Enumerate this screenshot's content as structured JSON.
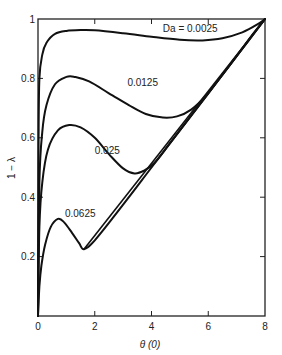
{
  "chart_data": {
    "type": "line",
    "title": "",
    "xlabel": "θ (0)",
    "ylabel": "1 − λ",
    "xlim": [
      0,
      8
    ],
    "ylim": [
      0,
      1
    ],
    "x_ticks": [
      0,
      2,
      4,
      6,
      8
    ],
    "x_tick_labels": [
      "0",
      "2",
      "4",
      "6",
      "8"
    ],
    "y_ticks": [
      0.2,
      0.4,
      0.6,
      0.8,
      1.0
    ],
    "y_tick_labels": [
      "0.2",
      "0.4",
      "0.6",
      "0.8",
      "1"
    ],
    "grid": false,
    "legend": "inline curve labels",
    "series": [
      {
        "name": "Da = 0.0025",
        "label": "Da = 0.0025",
        "label_pos": [
          4.4,
          0.955
        ],
        "points": [
          [
            0,
            0.0
          ],
          [
            0.02,
            0.6
          ],
          [
            0.05,
            0.8
          ],
          [
            0.15,
            0.88
          ],
          [
            0.3,
            0.92
          ],
          [
            0.6,
            0.95
          ],
          [
            1.0,
            0.96
          ],
          [
            1.5,
            0.963
          ],
          [
            2.0,
            0.962
          ],
          [
            3.0,
            0.952
          ],
          [
            4.0,
            0.94
          ],
          [
            5.0,
            0.93
          ],
          [
            5.8,
            0.928
          ],
          [
            6.5,
            0.935
          ],
          [
            7.2,
            0.955
          ],
          [
            7.7,
            0.98
          ],
          [
            8.0,
            1.0
          ]
        ]
      },
      {
        "name": "Da = 0.0125",
        "label": "0.0125",
        "label_pos": [
          3.15,
          0.775
        ],
        "points": [
          [
            0,
            0.0
          ],
          [
            0.05,
            0.45
          ],
          [
            0.15,
            0.62
          ],
          [
            0.3,
            0.71
          ],
          [
            0.6,
            0.78
          ],
          [
            1.0,
            0.805
          ],
          [
            1.3,
            0.805
          ],
          [
            1.8,
            0.79
          ],
          [
            2.5,
            0.75
          ],
          [
            3.2,
            0.71
          ],
          [
            3.8,
            0.68
          ],
          [
            4.4,
            0.668
          ],
          [
            4.9,
            0.672
          ],
          [
            5.4,
            0.695
          ],
          [
            5.9,
            0.74
          ],
          [
            6.4,
            0.8
          ],
          [
            7.0,
            0.875
          ],
          [
            7.5,
            0.94
          ],
          [
            8.0,
            1.0
          ]
        ]
      },
      {
        "name": "Da = 0.025",
        "label": "0.025",
        "label_pos": [
          2.0,
          0.545
        ],
        "points": [
          [
            0,
            0.0
          ],
          [
            0.05,
            0.3
          ],
          [
            0.15,
            0.45
          ],
          [
            0.35,
            0.56
          ],
          [
            0.7,
            0.625
          ],
          [
            1.1,
            0.643
          ],
          [
            1.5,
            0.635
          ],
          [
            2.0,
            0.6
          ],
          [
            2.5,
            0.545
          ],
          [
            3.0,
            0.497
          ],
          [
            3.4,
            0.48
          ],
          [
            3.75,
            0.49
          ],
          [
            4.1,
            0.515
          ],
          [
            4.6,
            0.575
          ],
          [
            5.2,
            0.65
          ],
          [
            6.0,
            0.75
          ],
          [
            7.0,
            0.875
          ],
          [
            8.0,
            1.0
          ]
        ]
      },
      {
        "name": "Da = 0.0625",
        "label": "0.0625",
        "label_pos": [
          0.95,
          0.335
        ],
        "points": [
          [
            0,
            0.0
          ],
          [
            0.05,
            0.1
          ],
          [
            0.12,
            0.17
          ],
          [
            0.25,
            0.24
          ],
          [
            0.45,
            0.3
          ],
          [
            0.7,
            0.327
          ],
          [
            0.9,
            0.318
          ],
          [
            1.2,
            0.28
          ],
          [
            1.45,
            0.245
          ],
          [
            1.62,
            0.225
          ],
          [
            2.0,
            0.255
          ],
          [
            3.0,
            0.375
          ],
          [
            4.0,
            0.5
          ],
          [
            5.0,
            0.625
          ],
          [
            6.0,
            0.75
          ],
          [
            7.0,
            0.875
          ],
          [
            8.0,
            1.0
          ]
        ]
      }
    ],
    "asymptote": {
      "name": "limiting line 1 − λ ≈ θ/8",
      "points": [
        [
          1.62,
          0.225
        ],
        [
          8.0,
          1.0
        ]
      ]
    }
  }
}
